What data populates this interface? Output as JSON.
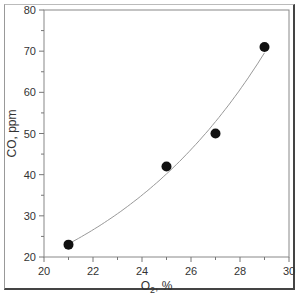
{
  "chart_data": {
    "type": "scatter",
    "title": "",
    "xlabel": "O2, %",
    "ylabel": "CO, ppm",
    "xlim": [
      20,
      30
    ],
    "ylim": [
      20,
      80
    ],
    "x_ticks": [
      20,
      22,
      24,
      26,
      28,
      30
    ],
    "y_ticks": [
      20,
      30,
      40,
      50,
      60,
      70,
      80
    ],
    "grid": false,
    "legend": null,
    "series": [
      {
        "name": "measurements",
        "marker": "filled-circle",
        "color": "#111111",
        "x": [
          21,
          25,
          27,
          29
        ],
        "y": [
          23,
          42,
          50,
          71
        ]
      }
    ],
    "trendline": {
      "type": "exponential-fit",
      "color": "#999999",
      "x_range": [
        21,
        29
      ]
    }
  },
  "axes": {
    "x_label_main": "O",
    "x_label_sub": "2",
    "x_label_rest": ", %",
    "y_label": "CO, ppm"
  }
}
